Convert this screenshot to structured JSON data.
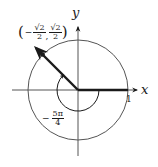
{
  "diagram": {
    "type": "unit-circle-angle",
    "axes": {
      "x_label": "x",
      "y_label": "y",
      "unit_tick_label": "1"
    },
    "point": {
      "open_paren": "(",
      "x_sign": "−",
      "x_num": "√2",
      "x_den": "2",
      "separator": ",",
      "y_num": "√2",
      "y_den": "2",
      "close_paren": ")"
    },
    "angle": {
      "sign": "−",
      "num": "5π",
      "den": "4",
      "direction": "clockwise"
    },
    "colors": {
      "ink": "#1a1a1a",
      "circle": "#555555",
      "background": "#ffffff"
    }
  }
}
